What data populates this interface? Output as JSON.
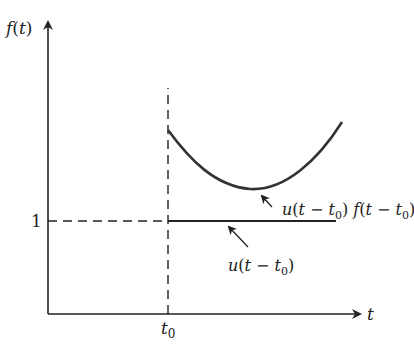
{
  "diagram": {
    "y_axis_label": {
      "f": "f",
      "open": "(",
      "t": "t",
      "close": ")"
    },
    "x_axis_label": "t",
    "y_tick_one": "1",
    "x_tick_t0": {
      "t": "t",
      "sub": "0"
    },
    "curve_label": {
      "u": "u",
      "open": "(",
      "t": "t",
      "minus": " − ",
      "t2": "t",
      "sub": "0",
      "close": ")",
      "f": " f",
      "open2": "(",
      "t3": "t",
      "minus2": " − ",
      "t4": "t",
      "sub2": "0",
      "close2": ")"
    },
    "step_label": {
      "u": "u",
      "open": "(",
      "t": "t",
      "minus": " − ",
      "t2": "t",
      "sub": "0",
      "close": ")"
    },
    "colors": {
      "axis": "#222222",
      "curve": "#333333",
      "dashed": "#222222"
    }
  }
}
